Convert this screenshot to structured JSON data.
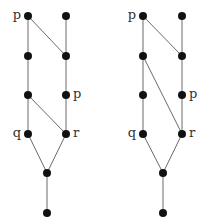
{
  "diagrams": [
    {
      "id": "left",
      "nodes": [
        {
          "x": 28,
          "y": 16,
          "label": "p",
          "label_side": "left"
        },
        {
          "x": 66,
          "y": 16,
          "label": ""
        },
        {
          "x": 28,
          "y": 56,
          "label": ""
        },
        {
          "x": 66,
          "y": 56,
          "label": ""
        },
        {
          "x": 28,
          "y": 95,
          "label": ""
        },
        {
          "x": 66,
          "y": 95,
          "label": "p",
          "label_side": "right"
        },
        {
          "x": 28,
          "y": 134,
          "label": "q",
          "label_side": "left"
        },
        {
          "x": 66,
          "y": 134,
          "label": "r",
          "label_side": "right"
        },
        {
          "x": 47,
          "y": 173,
          "label": ""
        },
        {
          "x": 47,
          "y": 213,
          "label": ""
        }
      ],
      "edges": [
        [
          0,
          2
        ],
        [
          0,
          3
        ],
        [
          1,
          3
        ],
        [
          2,
          4
        ],
        [
          3,
          5
        ],
        [
          4,
          6
        ],
        [
          4,
          7
        ],
        [
          5,
          7
        ],
        [
          6,
          8
        ],
        [
          7,
          8
        ],
        [
          8,
          9
        ]
      ]
    },
    {
      "id": "right",
      "nodes": [
        {
          "x": 143,
          "y": 16,
          "label": "p",
          "label_side": "left"
        },
        {
          "x": 182,
          "y": 16,
          "label": ""
        },
        {
          "x": 143,
          "y": 56,
          "label": ""
        },
        {
          "x": 182,
          "y": 56,
          "label": ""
        },
        {
          "x": 143,
          "y": 95,
          "label": ""
        },
        {
          "x": 182,
          "y": 95,
          "label": "p",
          "label_side": "right"
        },
        {
          "x": 143,
          "y": 134,
          "label": "q",
          "label_side": "left"
        },
        {
          "x": 182,
          "y": 134,
          "label": "r",
          "label_side": "right"
        },
        {
          "x": 163,
          "y": 173,
          "label": ""
        },
        {
          "x": 163,
          "y": 213,
          "label": ""
        }
      ],
      "edges": [
        [
          0,
          2
        ],
        [
          0,
          3
        ],
        [
          1,
          3
        ],
        [
          2,
          4
        ],
        [
          2,
          7
        ],
        [
          3,
          5
        ],
        [
          4,
          6
        ],
        [
          5,
          7
        ],
        [
          6,
          8
        ],
        [
          7,
          8
        ],
        [
          8,
          9
        ]
      ]
    }
  ],
  "colors": {
    "node": "#111111",
    "edge": "#6a6a6a",
    "label": "#333333"
  }
}
